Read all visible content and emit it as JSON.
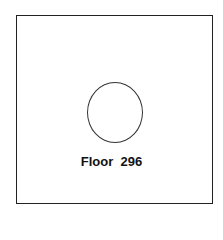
{
  "diagram": {
    "label": "Floor  296",
    "shape": "circle"
  }
}
